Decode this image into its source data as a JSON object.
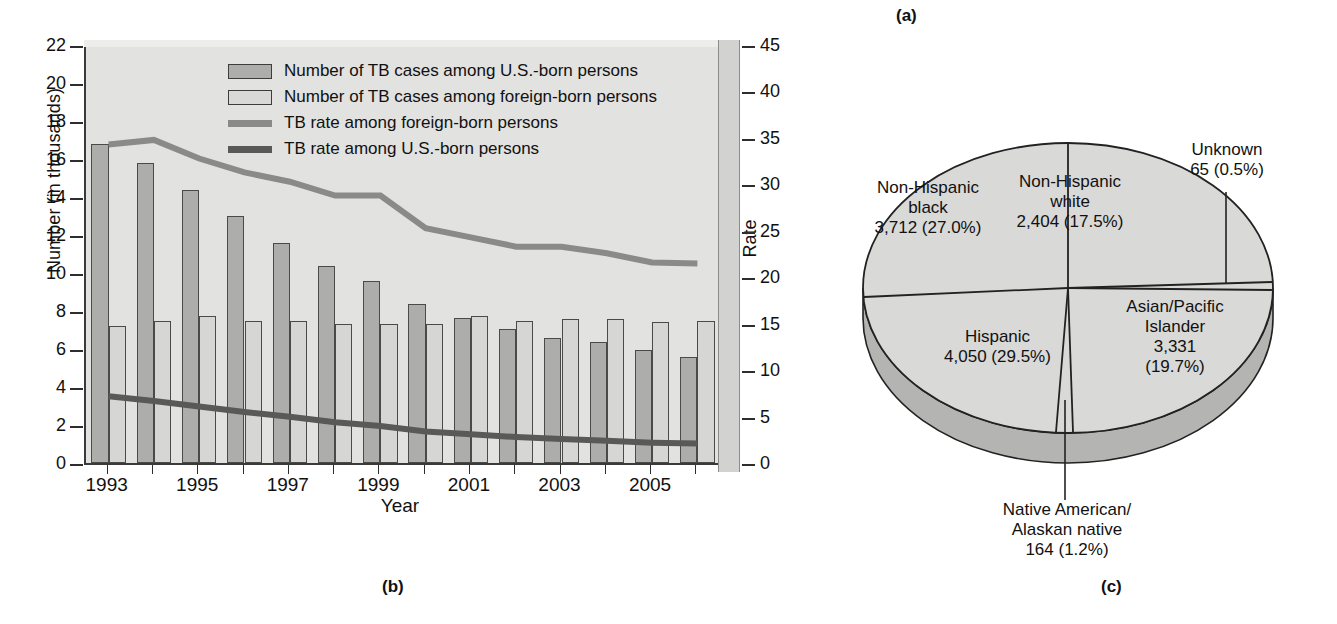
{
  "panels": {
    "a": "(a)",
    "b": "(b)",
    "c": "(c)"
  },
  "chart_data": [
    {
      "type": "bar",
      "panel": "(b)",
      "title": "",
      "xlabel": "Year",
      "ylabel": "Number (in thousands)",
      "y2label": "Rate",
      "ylim": [
        0,
        22
      ],
      "y2lim": [
        0,
        45
      ],
      "grid": false,
      "legend_position": "top-center",
      "categories": [
        1993,
        1994,
        1995,
        1996,
        1997,
        1998,
        1999,
        2000,
        2001,
        2002,
        2003,
        2004,
        2005,
        2006
      ],
      "tick_labels_x": [
        "1993",
        "1995",
        "1997",
        "1999",
        "2001",
        "2003",
        "2005"
      ],
      "tick_labels_y": [
        "0",
        "2",
        "4",
        "6",
        "8",
        "10",
        "12",
        "14",
        "16",
        "18",
        "20",
        "22"
      ],
      "tick_labels_y2": [
        "0",
        "5",
        "10",
        "15",
        "20",
        "25",
        "30",
        "35",
        "40",
        "45"
      ],
      "series": [
        {
          "name": "Number of TB cases among U.S.-born persons",
          "kind": "bar",
          "axis": "left",
          "color": "#adadab",
          "values": [
            16.8,
            15.8,
            14.35,
            13.0,
            11.6,
            10.35,
            9.6,
            8.35,
            7.65,
            7.05,
            6.6,
            6.35,
            5.95,
            5.6
          ]
        },
        {
          "name": "Number of TB cases among foreign-born persons",
          "kind": "bar",
          "axis": "left",
          "color": "#d6d6d4",
          "values": [
            7.2,
            7.5,
            7.75,
            7.45,
            7.5,
            7.3,
            7.3,
            7.3,
            7.75,
            7.45,
            7.6,
            7.6,
            7.4,
            7.45
          ]
        },
        {
          "name": "TB rate among foreign-born persons",
          "kind": "line",
          "axis": "right",
          "color": "#8a8a88",
          "values": [
            34.5,
            35.0,
            33.0,
            31.5,
            30.5,
            29.0,
            29.0,
            25.5,
            24.5,
            23.5,
            23.5,
            22.8,
            21.8,
            21.7
          ]
        },
        {
          "name": "TB rate among U.S.-born persons",
          "kind": "line",
          "axis": "right",
          "color": "#595957",
          "values": [
            7.4,
            6.9,
            6.3,
            5.7,
            5.2,
            4.6,
            4.2,
            3.6,
            3.3,
            3.0,
            2.8,
            2.6,
            2.4,
            2.3
          ]
        }
      ]
    },
    {
      "type": "pie",
      "panel": "(c)",
      "title": "",
      "labels": [
        "Non-Hispanic white",
        "Asian/Pacific Islander",
        "Unknown",
        "Native American/ Alaskan native",
        "Hispanic",
        "Non-Hispanic black"
      ],
      "values": [
        2404,
        3331,
        65,
        164,
        4050,
        3712
      ],
      "percents": [
        17.5,
        19.7,
        0.5,
        1.2,
        29.5,
        27.0
      ],
      "slice_labels": [
        {
          "name": "Non-Hispanic white",
          "line1": "Non-Hispanic",
          "line2": "white",
          "line3": "2,404 (17.5%)"
        },
        {
          "name": "Asian/Pacific Islander",
          "line1": "Asian/Pacific",
          "line2": "Islander",
          "line3": "3,331",
          "line4": "(19.7%)"
        },
        {
          "name": "Unknown",
          "line1": "Unknown",
          "line2": "65 (0.5%)"
        },
        {
          "name": "Native American/Alaskan native",
          "line1": "Native American/",
          "line2": "Alaskan native",
          "line3": "164 (1.2%)"
        },
        {
          "name": "Hispanic",
          "line1": "Hispanic",
          "line2": "4,050 (29.5%)"
        },
        {
          "name": "Non-Hispanic black",
          "line1": "Non-Hispanic",
          "line2": "black",
          "line3": "3,712 (27.0%)"
        }
      ]
    }
  ],
  "colors": {
    "plot_background": "#e2e2e0",
    "bar_us_born": "#adadab",
    "bar_foreign_born": "#d6d6d4",
    "line_foreign_born": "#8a8a88",
    "line_us_born": "#595957",
    "pie_face": "#d9d9d7",
    "pie_side": "#b4b4b2"
  }
}
